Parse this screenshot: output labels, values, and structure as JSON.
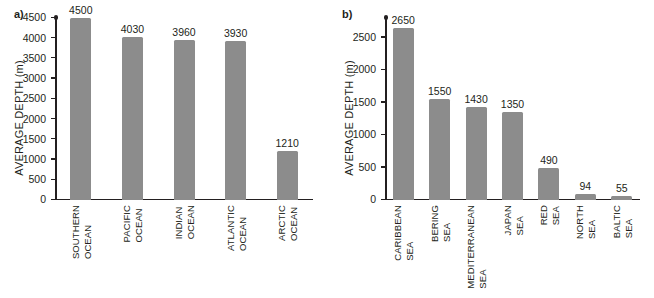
{
  "figure": {
    "panel_a_letter": "a)",
    "panel_b_letter": "b)",
    "bar_color": "#8c8c8c",
    "text_color": "#231f20"
  },
  "chart_data": [
    {
      "type": "bar",
      "panel": "a)",
      "title": "",
      "xlabel": "",
      "ylabel": "AVERAGE DEPTH (m)",
      "ylim": [
        0,
        4500
      ],
      "ytick_step": 500,
      "grid": false,
      "legend": "none",
      "categories": [
        "SOUTHERN OCEAN",
        "PACIFIC OCEAN",
        "INDIAN OCEAN",
        "ATLANTIC OCEAN",
        "ARCTIC OCEAN"
      ],
      "category_lines": [
        [
          "SOUTHERN",
          "OCEAN"
        ],
        [
          "PACIFIC",
          "OCEAN"
        ],
        [
          "INDIAN",
          "OCEAN"
        ],
        [
          "ATLANTIC",
          "OCEAN"
        ],
        [
          "ARCTIC",
          "OCEAN"
        ]
      ],
      "values": [
        4500,
        4030,
        3960,
        3930,
        1210
      ],
      "value_labels": [
        "4500",
        "4030",
        "3960",
        "3930",
        "1210"
      ],
      "ytick_labels": [
        "0",
        "500",
        "1000",
        "1500",
        "2000",
        "2500",
        "3000",
        "3500",
        "4000",
        "4500"
      ],
      "ytick_values": [
        0,
        500,
        1000,
        1500,
        2000,
        2500,
        3000,
        3500,
        4000,
        4500
      ]
    },
    {
      "type": "bar",
      "panel": "b)",
      "title": "",
      "xlabel": "",
      "ylabel": "AVERAGE DEPTH (m)",
      "ylim": [
        0,
        2800
      ],
      "ytick_step": 500,
      "grid": false,
      "legend": "none",
      "categories": [
        "CARIBBEAN SEA",
        "BERING SEA",
        "MEDITERRANEAN SEA",
        "JAPAN SEA",
        "RED SEA",
        "NORTH SEA",
        "BALTIC SEA"
      ],
      "category_lines": [
        [
          "CARIBBEAN",
          "SEA"
        ],
        [
          "BERING",
          "SEA"
        ],
        [
          "MEDITERRANEAN",
          "SEA"
        ],
        [
          "JAPAN",
          "SEA"
        ],
        [
          "RED",
          "SEA"
        ],
        [
          "NORTH",
          "SEA"
        ],
        [
          "BALTIC",
          "SEA"
        ]
      ],
      "values": [
        2650,
        1550,
        1430,
        1350,
        490,
        94,
        55
      ],
      "value_labels": [
        "2650",
        "1550",
        "1430",
        "1350",
        "490",
        "94",
        "55"
      ],
      "ytick_labels": [
        "0",
        "500",
        "1000",
        "1500",
        "2000",
        "2500"
      ],
      "ytick_values": [
        0,
        500,
        1000,
        1500,
        2000,
        2500
      ]
    }
  ]
}
